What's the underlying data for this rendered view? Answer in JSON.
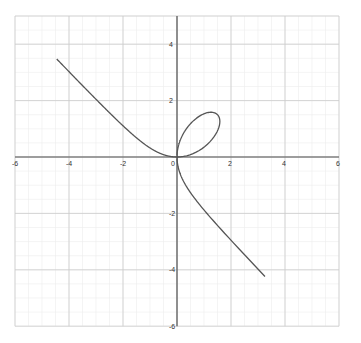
{
  "chart_data": {
    "type": "line",
    "title": "",
    "xlabel": "",
    "ylabel": "",
    "equation": "x^3 + y^3 = 3xy",
    "xlim": [
      -6,
      6
    ],
    "ylim": [
      -6,
      5
    ],
    "grid": true,
    "x_ticks": [
      -6,
      -4,
      -2,
      0,
      2,
      4,
      6
    ],
    "x_tick_labels": [
      "-6",
      "-4",
      "-2",
      "0",
      "2",
      "4",
      "6"
    ],
    "y_ticks": [
      -6,
      -4,
      -2,
      2,
      4
    ],
    "y_tick_labels": [
      "-6",
      "-4",
      "-2",
      "2",
      "4"
    ],
    "series": [
      {
        "name": "folium of Descartes",
        "color": "#555555",
        "points": [
          [
            -6,
            5.0
          ],
          [
            -4,
            3.0
          ],
          [
            -3,
            2.02
          ],
          [
            -2,
            1.1
          ],
          [
            -1,
            0.38
          ],
          [
            -0.5,
            0.1
          ],
          [
            0,
            0
          ],
          [
            0.5,
            1.1
          ],
          [
            1.0,
            1.45
          ],
          [
            1.5,
            1.5
          ],
          [
            1.5,
            1.1
          ],
          [
            1.2,
            0.6
          ],
          [
            0.6,
            0.15
          ],
          [
            0,
            0
          ],
          [
            0.1,
            -0.5
          ],
          [
            0.38,
            -1
          ],
          [
            1.1,
            -2
          ],
          [
            2.02,
            -3
          ],
          [
            3.0,
            -4
          ],
          [
            5.0,
            -6
          ]
        ]
      }
    ]
  },
  "colors": {
    "curve": "#555555",
    "axis": "#555555",
    "grid_major": "#cccccc",
    "grid_minor": "#ececec"
  }
}
